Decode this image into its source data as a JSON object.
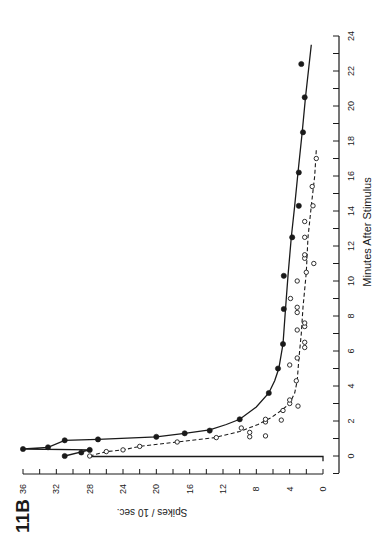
{
  "figure": {
    "label": "11B",
    "ink_color": "#1a1a1a",
    "background": "#ffffff"
  },
  "chart_data": {
    "type": "scatter",
    "title": "",
    "figure_label": "11B",
    "orientation_note": "figure printed rotated 90 degrees clockwise",
    "xlabel": "Minutes After Stimulus",
    "ylabel": "Spikes / 10 sec.",
    "xlim": [
      -1,
      24
    ],
    "ylim": [
      0,
      36
    ],
    "xticks": [
      0,
      2,
      4,
      6,
      8,
      10,
      12,
      14,
      16,
      18,
      20,
      22,
      24
    ],
    "xtick_labels": [
      "0",
      "2",
      "4",
      "6",
      "8",
      "10",
      "12",
      "14",
      "16",
      "18",
      "20",
      "22",
      "24"
    ],
    "yticks": [
      0,
      4,
      8,
      12,
      16,
      20,
      24,
      28,
      32,
      36
    ],
    "ytick_labels": [
      "0",
      "4",
      "8",
      "12",
      "16",
      "20",
      "24",
      "28",
      "32",
      "36"
    ],
    "grid": false,
    "legend": null,
    "stimulus_marker": {
      "x_start": 0,
      "x_end": 0,
      "height_spikes": 28
    },
    "series": [
      {
        "name": "filled circles",
        "marker": "filled-circle",
        "line": "solid",
        "points": [
          [
            0.0,
            31
          ],
          [
            0.2,
            29
          ],
          [
            0.35,
            28
          ],
          [
            0.4,
            36
          ],
          [
            0.5,
            33
          ],
          [
            0.9,
            31
          ],
          [
            0.95,
            27
          ],
          [
            1.1,
            20
          ],
          [
            1.3,
            16.6
          ],
          [
            1.45,
            13.6
          ],
          [
            2.1,
            10
          ],
          [
            3.6,
            6.5
          ],
          [
            5.0,
            5.4
          ],
          [
            6.4,
            4.8
          ],
          [
            8.4,
            4.7
          ],
          [
            10.3,
            4.7
          ],
          [
            12.5,
            3.7
          ],
          [
            14.3,
            2.9
          ],
          [
            16.2,
            2.9
          ],
          [
            18.5,
            2.4
          ],
          [
            20.5,
            2.2
          ],
          [
            22.4,
            2.6
          ]
        ],
        "fit_curve": [
          [
            0.0,
            31
          ],
          [
            0.35,
            28
          ],
          [
            0.4,
            36
          ],
          [
            0.5,
            33
          ],
          [
            0.9,
            31
          ],
          [
            0.95,
            27
          ],
          [
            1.1,
            20
          ],
          [
            1.3,
            16.6
          ],
          [
            1.5,
            13.6
          ],
          [
            1.8,
            11.6
          ],
          [
            2.1,
            10
          ],
          [
            2.8,
            8
          ],
          [
            3.6,
            6.5
          ],
          [
            4.3,
            5.8
          ],
          [
            5.0,
            5.3
          ],
          [
            6.4,
            4.8
          ],
          [
            8.4,
            4.5
          ],
          [
            10.3,
            4.2
          ],
          [
            12.5,
            3.8
          ],
          [
            14.3,
            3.4
          ],
          [
            16.2,
            3.0
          ],
          [
            18.5,
            2.5
          ],
          [
            20.5,
            2.1
          ],
          [
            23.5,
            1.4
          ]
        ]
      },
      {
        "name": "open circles",
        "marker": "open-circle",
        "line": "dashed",
        "points": [
          [
            0.0,
            28
          ],
          [
            0.25,
            26
          ],
          [
            0.35,
            24
          ],
          [
            0.55,
            22
          ],
          [
            0.8,
            17.5
          ],
          [
            1.05,
            12.8
          ],
          [
            1.1,
            8.8
          ],
          [
            1.15,
            6.9
          ],
          [
            1.35,
            8.8
          ],
          [
            1.6,
            9.8
          ],
          [
            1.95,
            6.9
          ],
          [
            2.05,
            5
          ],
          [
            2.1,
            6.9
          ],
          [
            2.6,
            4.8
          ],
          [
            2.85,
            3.0
          ],
          [
            3.0,
            4.0
          ],
          [
            3.2,
            4.0
          ],
          [
            4.3,
            3.2
          ],
          [
            5.2,
            4.0
          ],
          [
            5.6,
            3.1
          ],
          [
            6.2,
            2.2
          ],
          [
            6.5,
            2.2
          ],
          [
            7.2,
            3.1
          ],
          [
            7.4,
            2.2
          ],
          [
            7.6,
            2.2
          ],
          [
            8.2,
            3.1
          ],
          [
            8.5,
            3.1
          ],
          [
            9.0,
            3.9
          ],
          [
            10.0,
            3.1
          ],
          [
            10.5,
            2.0
          ],
          [
            11.0,
            1.1
          ],
          [
            11.3,
            2.2
          ],
          [
            11.5,
            2.2
          ],
          [
            12.5,
            2.2
          ],
          [
            13.4,
            2.2
          ],
          [
            14.3,
            1.2
          ],
          [
            15.4,
            1.3
          ],
          [
            17.0,
            0.8
          ]
        ],
        "fit_curve": [
          [
            0.0,
            28
          ],
          [
            0.25,
            26
          ],
          [
            0.35,
            24
          ],
          [
            0.55,
            22
          ],
          [
            0.8,
            17.5
          ],
          [
            1.05,
            13
          ],
          [
            1.4,
            10
          ],
          [
            1.8,
            7.8
          ],
          [
            2.2,
            6.2
          ],
          [
            2.6,
            5.0
          ],
          [
            3.0,
            4.0
          ],
          [
            3.6,
            3.4
          ],
          [
            4.3,
            3.1
          ],
          [
            5.5,
            2.9
          ],
          [
            7.0,
            2.6
          ],
          [
            8.5,
            2.4
          ],
          [
            10.5,
            2.0
          ],
          [
            12.5,
            1.8
          ],
          [
            14.3,
            1.4
          ],
          [
            16.0,
            1.0
          ],
          [
            17.5,
            0.8
          ]
        ]
      }
    ]
  }
}
